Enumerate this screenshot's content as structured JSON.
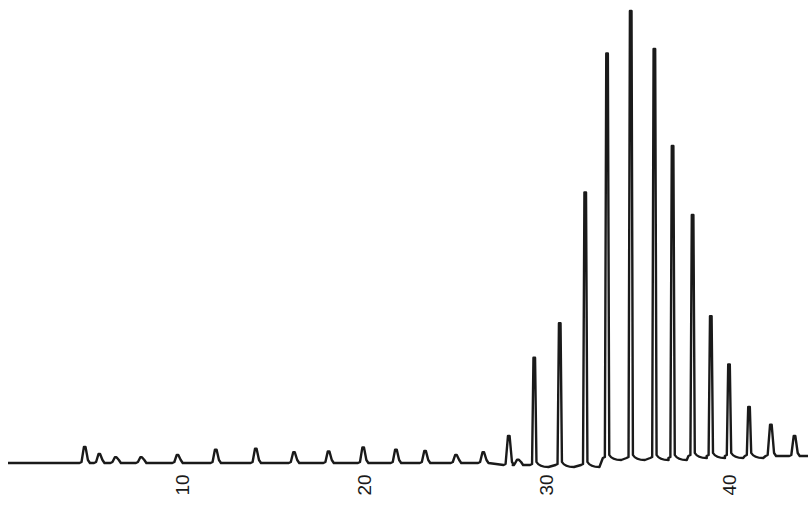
{
  "chart_data": {
    "type": "line",
    "title": "",
    "xlabel": "",
    "ylabel": "",
    "x_ticks": [
      10,
      20,
      30,
      40
    ],
    "xlim": [
      0,
      44
    ],
    "ylim": [
      0,
      100
    ],
    "grid": false,
    "legend": null,
    "line_color": "#1a1a1a",
    "peaks": {
      "x": [
        4.6,
        5.4,
        6.3,
        7.7,
        9.7,
        11.8,
        14.0,
        16.1,
        18.0,
        19.9,
        21.7,
        23.3,
        25.0,
        26.5,
        27.9,
        28.4,
        29.3,
        30.7,
        32.1,
        33.3,
        34.6,
        35.9,
        36.9,
        38.0,
        39.0,
        40.0,
        41.1,
        42.3,
        43.6
      ],
      "height": [
        3.6,
        2.0,
        1.3,
        1.3,
        1.8,
        3.0,
        3.2,
        2.4,
        2.6,
        3.5,
        3.0,
        2.7,
        1.8,
        2.4,
        6.5,
        1.2,
        24.0,
        31.7,
        61.0,
        90.5,
        100.0,
        91.5,
        69.8,
        53.9,
        31.3,
        20.5,
        11.0,
        7.0,
        4.5
      ]
    }
  },
  "axis": {
    "tick_labels": [
      "10",
      "20",
      "30",
      "40"
    ]
  }
}
